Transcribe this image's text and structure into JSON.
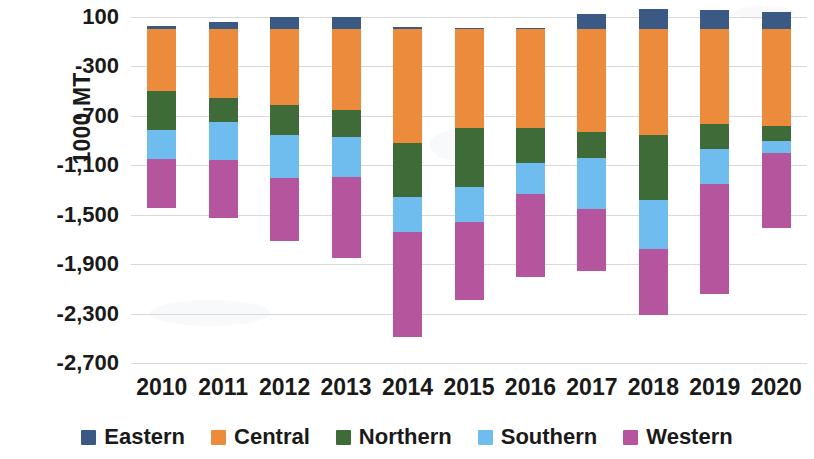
{
  "chart_data": {
    "type": "bar",
    "stacked": true,
    "title": "",
    "xlabel": "",
    "ylabel": "1000 MT",
    "categories": [
      "2010",
      "2011",
      "2012",
      "2013",
      "2014",
      "2015",
      "2016",
      "2017",
      "2018",
      "2019",
      "2020"
    ],
    "ylim": [
      -2700,
      100
    ],
    "yticks": [
      100,
      -300,
      -700,
      -1100,
      -1500,
      -1900,
      -2300,
      -2700
    ],
    "ytick_labels": [
      "100",
      "-300",
      "-700",
      "-1,100",
      "-1,500",
      "-1,900",
      "-2,300",
      "-2,700"
    ],
    "grid": true,
    "legend_position": "bottom",
    "series": [
      {
        "name": "Eastern",
        "color": "#3A5A85",
        "values": [
          24,
          56,
          96,
          96,
          20,
          12,
          8,
          124,
          164,
          156,
          140
        ]
      },
      {
        "name": "Central",
        "color": "#ED8B3C",
        "values": [
          -496,
          -552,
          -616,
          -656,
          -920,
          -800,
          -800,
          -832,
          -856,
          -768,
          -784
        ]
      },
      {
        "name": "Northern",
        "color": "#3E6B38",
        "values": [
          -320,
          -200,
          -240,
          -216,
          -440,
          -480,
          -280,
          -208,
          -528,
          -200,
          -120
        ]
      },
      {
        "name": "Southern",
        "color": "#6FBDEE",
        "values": [
          -232,
          -304,
          -344,
          -320,
          -280,
          -280,
          -256,
          -416,
          -392,
          -280,
          -96
        ]
      },
      {
        "name": "Western",
        "color": "#B4559E",
        "values": [
          -400,
          -472,
          -512,
          -656,
          -848,
          -632,
          -672,
          -496,
          -536,
          -896,
          -608
        ]
      }
    ],
    "totals": [
      -1424,
      -1472,
      -1616,
      -1752,
      -2468,
      -2180,
      -2000,
      -1828,
      -2148,
      -1988,
      -1468
    ]
  },
  "legend": {
    "items": [
      {
        "label": "Eastern",
        "color": "#3A5A85"
      },
      {
        "label": "Central",
        "color": "#ED8B3C"
      },
      {
        "label": "Northern",
        "color": "#3E6B38"
      },
      {
        "label": "Southern",
        "color": "#6FBDEE"
      },
      {
        "label": "Western",
        "color": "#B4559E"
      }
    ]
  }
}
